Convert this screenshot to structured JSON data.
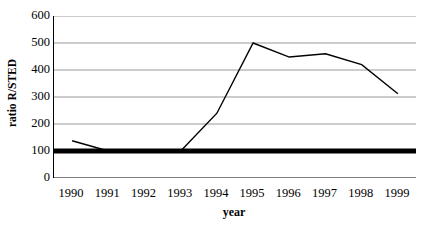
{
  "chart_data": {
    "type": "line",
    "title": "",
    "xlabel": "year",
    "ylabel": "ratio R/STED",
    "categories": [
      "1990",
      "1991",
      "1992",
      "1993",
      "1994",
      "1995",
      "1996",
      "1997",
      "1998",
      "1999"
    ],
    "series": [
      {
        "name": "ratio R/STED",
        "values": [
          138,
          100,
          100,
          100,
          240,
          500,
          448,
          460,
          420,
          312
        ],
        "color": "#000000"
      }
    ],
    "reference_line": {
      "name": "reference",
      "value": 100,
      "color": "#000000",
      "thickness_px": 5
    },
    "ylim": [
      0,
      600
    ],
    "yticks": [
      0,
      100,
      200,
      300,
      400,
      500,
      600
    ],
    "ytick_labels": [
      "0",
      "100",
      "200",
      "300",
      "400",
      "500",
      "600"
    ],
    "grid": true,
    "grid_color": "#999999",
    "legend": "none",
    "axis_color": "#000000",
    "background": "#ffffff"
  }
}
